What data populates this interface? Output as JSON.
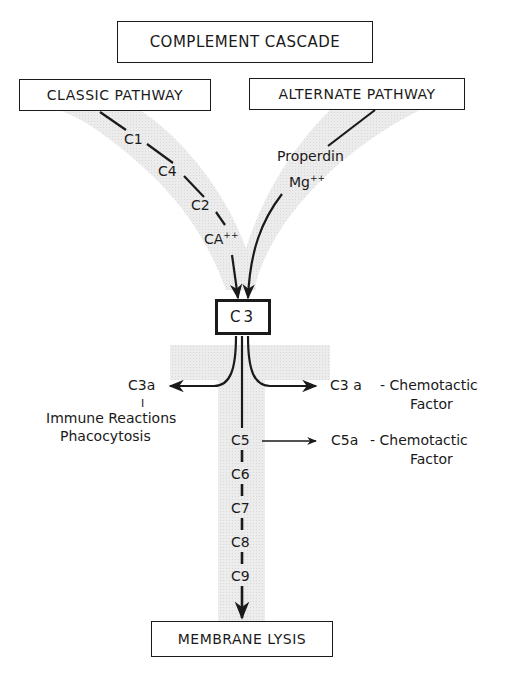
{
  "title": "COMPLEMENT CASCADE",
  "pathways": {
    "classic": {
      "label": "CLASSIC PATHWAY",
      "steps": [
        "C1",
        "C4",
        "C2",
        "CA"
      ],
      "cofactor_sup": "++"
    },
    "alternate": {
      "label": "ALTERNATE PATHWAY",
      "factor": "Properdin",
      "cofactor": "Mg",
      "cofactor_sup": "++"
    }
  },
  "central": {
    "label": "C3"
  },
  "branches": {
    "left": {
      "label": "C3a",
      "separator": "I",
      "effect_line1": "Immune Reactions",
      "effect_line2": "Phacocytosis"
    },
    "right": {
      "label": "C3 a",
      "effect_line1": "- Chemotactic",
      "effect_line2": "Factor"
    }
  },
  "terminal_chain": {
    "steps": [
      "C5",
      "C6",
      "C7",
      "C8",
      "C9"
    ],
    "c5_branch": {
      "label": "C5a",
      "effect_line1": "- Chemotactic",
      "effect_line2": "Factor"
    }
  },
  "outcome": {
    "label": "MEMBRANE LYSIS"
  },
  "colors": {
    "ink": "#1a1a1a",
    "shade": "#e6e6e6",
    "background": "#ffffff"
  }
}
